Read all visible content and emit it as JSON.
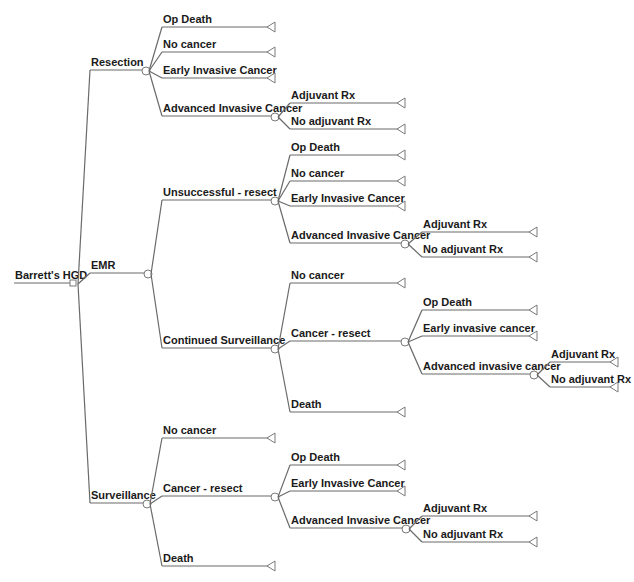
{
  "diagram": {
    "type": "decision-tree",
    "colors": {
      "line": "#6a6a6a",
      "text": "#1a1a1a",
      "background": "#ffffff"
    },
    "root": {
      "label": "Barrett's HGD",
      "node": "decision",
      "children": [
        {
          "label": "Resection",
          "node": "chance",
          "children": [
            {
              "label": "Op Death",
              "node": "terminal"
            },
            {
              "label": "No cancer",
              "node": "terminal"
            },
            {
              "label": "Early Invasive Cancer",
              "node": "terminal"
            },
            {
              "label": "Advanced Invasive Cancer",
              "node": "chance",
              "children": [
                {
                  "label": "Adjuvant Rx",
                  "node": "terminal"
                },
                {
                  "label": "No adjuvant Rx",
                  "node": "terminal"
                }
              ]
            }
          ]
        },
        {
          "label": "EMR",
          "node": "chance",
          "children": [
            {
              "label": "Unsuccessful - resect",
              "node": "chance",
              "children": [
                {
                  "label": "Op Death",
                  "node": "terminal"
                },
                {
                  "label": "No cancer",
                  "node": "terminal"
                },
                {
                  "label": "Early Invasive Cancer",
                  "node": "terminal"
                },
                {
                  "label": "Advanced Invasive Cancer",
                  "node": "chance",
                  "children": [
                    {
                      "label": "Adjuvant Rx",
                      "node": "terminal"
                    },
                    {
                      "label": "No adjuvant Rx",
                      "node": "terminal"
                    }
                  ]
                }
              ]
            },
            {
              "label": "Continued Surveillance",
              "node": "chance",
              "children": [
                {
                  "label": "No cancer",
                  "node": "terminal"
                },
                {
                  "label": "Cancer - resect",
                  "node": "chance",
                  "children": [
                    {
                      "label": "Op Death",
                      "node": "terminal"
                    },
                    {
                      "label": "Early invasive cancer",
                      "node": "terminal"
                    },
                    {
                      "label": "Advanced invasive cancer",
                      "node": "chance",
                      "children": [
                        {
                          "label": "Adjuvant Rx",
                          "node": "terminal"
                        },
                        {
                          "label": "No adjuvant Rx",
                          "node": "terminal"
                        }
                      ]
                    }
                  ]
                },
                {
                  "label": "Death",
                  "node": "terminal"
                }
              ]
            }
          ]
        },
        {
          "label": "Surveillance",
          "node": "chance",
          "children": [
            {
              "label": "No cancer",
              "node": "terminal"
            },
            {
              "label": "Cancer - resect",
              "node": "chance",
              "children": [
                {
                  "label": "Op Death",
                  "node": "terminal"
                },
                {
                  "label": "Early Invasive Cancer",
                  "node": "terminal"
                },
                {
                  "label": "Advanced Invasive Cancer",
                  "node": "chance",
                  "children": [
                    {
                      "label": "Adjuvant Rx",
                      "node": "terminal"
                    },
                    {
                      "label": "No adjuvant Rx",
                      "node": "terminal"
                    }
                  ]
                }
              ]
            },
            {
              "label": "Death",
              "node": "terminal"
            }
          ]
        }
      ]
    }
  }
}
